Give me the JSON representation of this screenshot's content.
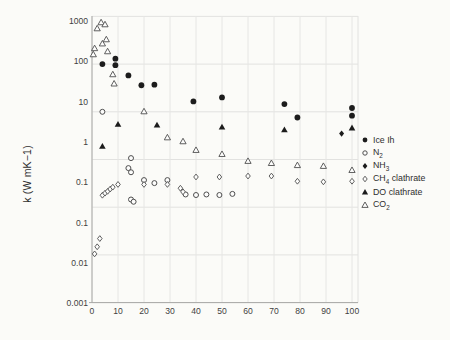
{
  "figure": {
    "y_axis_title": "k (W mK−1)"
  },
  "axes": {
    "y_tick_labels": [
      "1000",
      "100",
      "10",
      "1",
      "0.1",
      "0.1",
      "0.01",
      "0.001"
    ],
    "x_tick_labels": [
      "0",
      "10",
      "20",
      "30",
      "40",
      "50",
      "60",
      "70",
      "80",
      "90",
      "100"
    ]
  },
  "chart_data": {
    "type": "scatter",
    "title": "",
    "xlabel": "",
    "ylabel": "k (W mK−1)",
    "x_range": [
      0,
      100
    ],
    "y_scale": "log",
    "y_gridline_values": [
      1000,
      100,
      10,
      1,
      0.1,
      0.01,
      0.001
    ],
    "x_gridline_values": [
      0,
      10,
      20,
      30,
      40,
      50,
      60,
      70,
      80,
      90,
      100
    ],
    "grid": true,
    "legend_position": "right",
    "series": [
      {
        "id": "ice-ih",
        "label_pre": "Ice Ih",
        "label_sub": "",
        "label_post": "",
        "marker": "filled-circle",
        "points": [
          [
            4,
            100
          ],
          [
            9,
            130
          ],
          [
            9,
            95
          ],
          [
            14,
            58
          ],
          [
            19,
            36
          ],
          [
            24,
            37
          ],
          [
            39,
            16.5
          ],
          [
            50,
            20
          ],
          [
            74,
            14.5
          ],
          [
            79,
            7.6
          ],
          [
            100,
            12
          ],
          [
            100,
            8.3
          ]
        ]
      },
      {
        "id": "n2",
        "label_pre": "N",
        "label_sub": "2",
        "label_post": "",
        "marker": "open-circle",
        "points": [
          [
            4,
            10
          ],
          [
            15,
            1.07
          ],
          [
            14,
            0.66
          ],
          [
            15,
            0.54
          ],
          [
            15,
            0.145
          ],
          [
            16,
            0.13
          ],
          [
            20,
            0.37
          ],
          [
            24,
            0.32
          ],
          [
            29,
            0.37
          ],
          [
            36,
            0.185
          ],
          [
            40,
            0.18
          ],
          [
            44,
            0.185
          ],
          [
            49,
            0.18
          ],
          [
            54,
            0.19
          ]
        ]
      },
      {
        "id": "nh3",
        "label_pre": "NH",
        "label_sub": "3",
        "label_post": "",
        "marker": "filled-diamond",
        "points": [
          [
            96,
            3.5
          ]
        ]
      },
      {
        "id": "ch4-clathrate",
        "label_pre": "CH",
        "label_sub": "4",
        "label_post": " clathrate",
        "marker": "open-diamond",
        "points": [
          [
            1,
            0.0105
          ],
          [
            2,
            0.0148
          ],
          [
            3,
            0.022
          ],
          [
            4,
            0.178
          ],
          [
            5,
            0.197
          ],
          [
            6,
            0.215
          ],
          [
            7,
            0.24
          ],
          [
            8,
            0.263
          ],
          [
            10,
            0.3
          ],
          [
            20,
            0.3
          ],
          [
            29,
            0.3
          ],
          [
            34,
            0.25
          ],
          [
            35,
            0.21
          ],
          [
            40,
            0.43
          ],
          [
            49,
            0.43
          ],
          [
            60,
            0.45
          ],
          [
            69,
            0.45
          ],
          [
            79,
            0.35
          ],
          [
            89,
            0.34
          ],
          [
            100,
            0.35
          ]
        ]
      },
      {
        "id": "do-clathrate",
        "label_pre": "DO clathrate",
        "label_sub": "",
        "label_post": "",
        "marker": "filled-triangle",
        "points": [
          [
            4,
            1.9
          ],
          [
            10,
            5.5
          ],
          [
            25,
            5.3
          ],
          [
            50,
            4.8
          ],
          [
            74,
            4.2
          ],
          [
            100,
            4.6
          ]
        ]
      },
      {
        "id": "co2",
        "label_pre": "CO",
        "label_sub": "2",
        "label_post": "",
        "marker": "open-triangle",
        "points": [
          [
            0.5,
            160
          ],
          [
            1,
            215
          ],
          [
            2,
            560
          ],
          [
            3.5,
            750
          ],
          [
            4,
            270
          ],
          [
            5,
            680
          ],
          [
            5.5,
            330
          ],
          [
            6,
            185
          ],
          [
            8,
            61
          ],
          [
            8.5,
            39
          ],
          [
            20,
            10.2
          ],
          [
            29,
            2.9
          ],
          [
            35,
            2.4
          ],
          [
            40,
            1.58
          ],
          [
            50,
            1.3
          ],
          [
            60,
            0.93
          ],
          [
            69,
            0.84
          ],
          [
            79,
            0.76
          ],
          [
            89,
            0.73
          ],
          [
            100,
            0.6
          ]
        ]
      }
    ]
  }
}
